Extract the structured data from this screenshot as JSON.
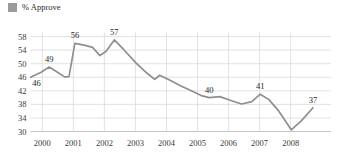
{
  "legend": {
    "swatch_color": "#9a9a9a",
    "label": "% Approve"
  },
  "chart_data": {
    "type": "line",
    "title": "",
    "subtitle": "",
    "xlabel": "",
    "ylabel": "",
    "grid": true,
    "legend_position": "top-left",
    "line_color": "#8f8f8f",
    "xlim": [
      1999.62,
      2009.3
    ],
    "ylim": [
      30,
      59.2
    ],
    "yticks": [
      30,
      34,
      38,
      42,
      46,
      50,
      54,
      58
    ],
    "ytick_labels": [
      "30",
      "34",
      "38",
      "42",
      "46",
      "50",
      "54",
      "58"
    ],
    "xticks": [
      2000,
      2001,
      2002,
      2003,
      2004,
      2005,
      2006,
      2007,
      2008
    ],
    "xtick_labels": [
      "2000",
      "2001",
      "2002",
      "2003",
      "2004",
      "2005",
      "2006",
      "2007",
      "2008"
    ],
    "series": [
      {
        "name": "% Approve",
        "x": [
          1999.62,
          1999.95,
          2000.22,
          2000.45,
          2000.72,
          2000.86,
          2001.05,
          2001.38,
          2001.62,
          2001.85,
          2002.05,
          2002.32,
          2002.62,
          2003.0,
          2003.35,
          2003.62,
          2003.78,
          2004.1,
          2004.45,
          2004.8,
          2005.12,
          2005.38,
          2005.72,
          2006.05,
          2006.42,
          2006.75,
          2007.02,
          2007.3,
          2007.62,
          2008.02,
          2008.35,
          2008.72
        ],
        "values": [
          46,
          47.4,
          49,
          47.7,
          46.1,
          46.2,
          56,
          55.4,
          54.8,
          52.4,
          53.6,
          57,
          54.2,
          50.4,
          47.4,
          45.4,
          46.6,
          45.2,
          43.5,
          42.0,
          40.6,
          40,
          40.3,
          39.2,
          38.1,
          38.8,
          41,
          39.4,
          36.0,
          30.5,
          33.2,
          37
        ]
      }
    ],
    "point_labels": [
      {
        "text": "46",
        "x": 1999.62,
        "value": 46,
        "anchor": "below-right"
      },
      {
        "text": "49",
        "x": 2000.22,
        "value": 49,
        "anchor": "above"
      },
      {
        "text": "56",
        "x": 2001.05,
        "value": 56,
        "anchor": "above"
      },
      {
        "text": "57",
        "x": 2002.32,
        "value": 57,
        "anchor": "above"
      },
      {
        "text": "40",
        "x": 2005.38,
        "value": 40,
        "anchor": "above"
      },
      {
        "text": "41",
        "x": 2007.02,
        "value": 41,
        "anchor": "above"
      },
      {
        "text": "37",
        "x": 2008.72,
        "value": 37,
        "anchor": "above"
      }
    ]
  }
}
